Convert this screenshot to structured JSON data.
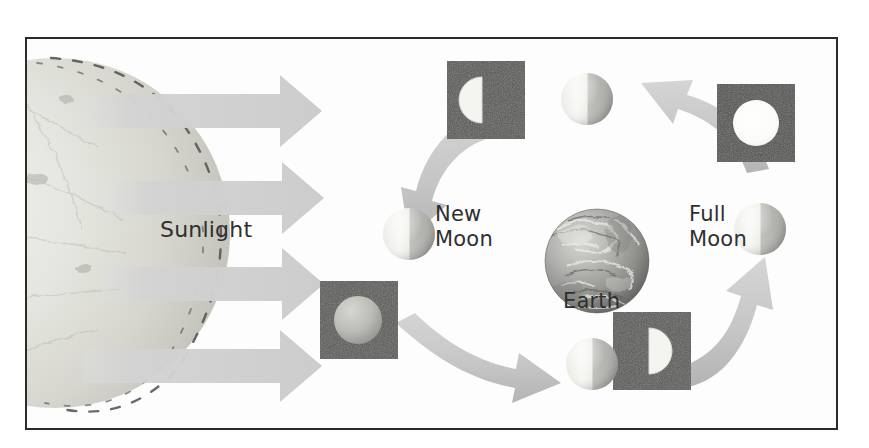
{
  "figure": {
    "background_color": "#ffffff",
    "frame_color": "#2b2b2b",
    "arrow_color": "#c9c9c9",
    "box_color": "#5a5a5a",
    "labels": {
      "sunlight": "Sunlight",
      "new_moon": "New\nMoon",
      "full_moon": "Full\nMoon",
      "earth": "Earth"
    },
    "bodies": [
      {
        "name": "sun",
        "kind": "sun",
        "note": "large pale sphere at left edge, partially cropped"
      },
      {
        "name": "earth",
        "kind": "earth",
        "note": "textured gray sphere at center"
      },
      {
        "name": "moon-top",
        "kind": "moon",
        "phase": "lit-left",
        "note": "orbit position above Earth"
      },
      {
        "name": "moon-left",
        "kind": "moon",
        "phase": "lit-left",
        "note": "orbit position left of Earth, New Moon"
      },
      {
        "name": "moon-bottom",
        "kind": "moon",
        "phase": "lit-left",
        "note": "orbit position below Earth"
      },
      {
        "name": "moon-right",
        "kind": "moon",
        "phase": "lit-left",
        "note": "orbit position right of Earth, Full Moon"
      }
    ],
    "phase_boxes": [
      {
        "name": "phase-box-top-left",
        "phase": "half-lit-left",
        "appearance": "dark square with half disc lit on the left"
      },
      {
        "name": "phase-box-top-right",
        "phase": "full",
        "appearance": "dark square with full bright disc"
      },
      {
        "name": "phase-box-bottom-left",
        "phase": "new",
        "appearance": "dark square with dim gray disc"
      },
      {
        "name": "phase-box-bottom-right",
        "phase": "half-lit-right",
        "appearance": "dark square with half disc lit on the right"
      }
    ],
    "sunlight_rays": [
      {
        "name": "sunlight-ray-1"
      },
      {
        "name": "sunlight-ray-2"
      },
      {
        "name": "sunlight-ray-3"
      },
      {
        "name": "sunlight-ray-4"
      }
    ],
    "orbit_arrows": [
      {
        "name": "orbit-arrow-top-left",
        "direction": "down-left, from top box toward New Moon"
      },
      {
        "name": "orbit-arrow-bottom-left",
        "direction": "right-down, from bottom-left box toward bottom Moon"
      },
      {
        "name": "orbit-arrow-bottom-right",
        "direction": "up-right, from bottom-right box toward Full Moon"
      },
      {
        "name": "orbit-arrow-top-right",
        "direction": "up-left, from right side toward top Moon"
      }
    ]
  }
}
